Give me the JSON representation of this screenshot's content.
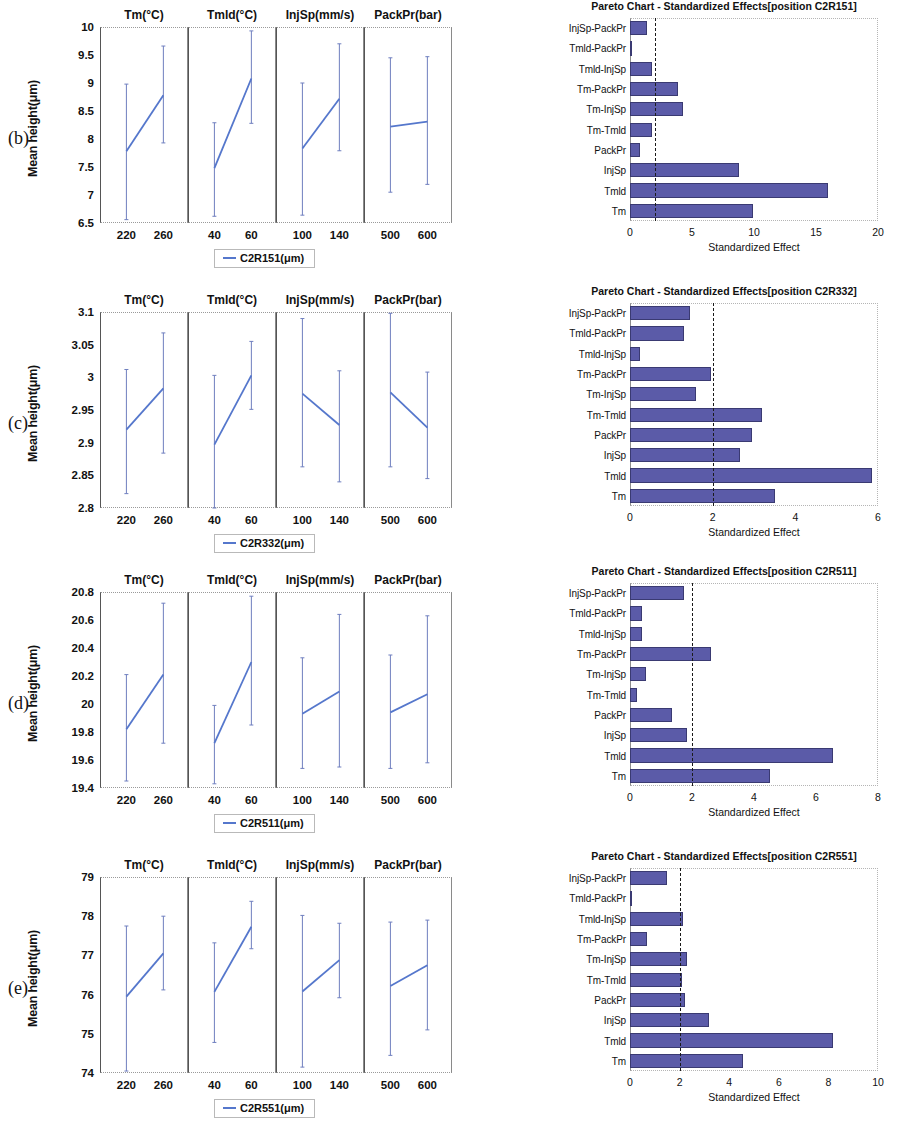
{
  "figure": {
    "panels": [
      {
        "letter": "(b)",
        "main_effects": {
          "ylabel": "Mean height(μm)",
          "legend_label": "C2R151(μm)",
          "yticks": [
            "6.5",
            "7",
            "7.5",
            "8",
            "8.5",
            "9",
            "9.5",
            "10"
          ],
          "facets": [
            {
              "title": "Tm(°C)",
              "xticks": [
                "220",
                "260"
              ]
            },
            {
              "title": "Tmld(°C)",
              "xticks": [
                "40",
                "60"
              ]
            },
            {
              "title": "InjSp(mm/s)",
              "xticks": [
                "100",
                "140"
              ]
            },
            {
              "title": "PackPr(bar)",
              "xticks": [
                "500",
                "600"
              ]
            }
          ]
        },
        "pareto": {
          "title": "Pareto Chart - Standardized Effects[position C2R151]",
          "xlabel": "Standardized Effect",
          "xticks": [
            "0",
            "5",
            "10",
            "15",
            "20"
          ]
        }
      },
      {
        "letter": "(c)",
        "main_effects": {
          "ylabel": "Mean height(μm)",
          "legend_label": "C2R332(μm)",
          "yticks": [
            "2.8",
            "2.85",
            "2.9",
            "2.95",
            "3",
            "3.05",
            "3.1"
          ],
          "facets": [
            {
              "title": "Tm(°C)",
              "xticks": [
                "220",
                "260"
              ]
            },
            {
              "title": "Tmld(°C)",
              "xticks": [
                "40",
                "60"
              ]
            },
            {
              "title": "InjSp(mm/s)",
              "xticks": [
                "100",
                "140"
              ]
            },
            {
              "title": "PackPr(bar)",
              "xticks": [
                "500",
                "600"
              ]
            }
          ]
        },
        "pareto": {
          "title": "Pareto Chart - Standardized Effects[position C2R332]",
          "xlabel": "Standardized Effect",
          "xticks": [
            "0",
            "2",
            "4",
            "6"
          ]
        }
      },
      {
        "letter": "(d)",
        "main_effects": {
          "ylabel": "Mean height(μm)",
          "legend_label": "C2R511(μm)",
          "yticks": [
            "19.4",
            "19.6",
            "19.8",
            "20",
            "20.2",
            "20.4",
            "20.6",
            "20.8"
          ],
          "facets": [
            {
              "title": "Tm(°C)",
              "xticks": [
                "220",
                "260"
              ]
            },
            {
              "title": "Tmld(°C)",
              "xticks": [
                "40",
                "60"
              ]
            },
            {
              "title": "InjSp(mm/s)",
              "xticks": [
                "100",
                "140"
              ]
            },
            {
              "title": "PackPr(bar)",
              "xticks": [
                "500",
                "600"
              ]
            }
          ]
        },
        "pareto": {
          "title": "Pareto Chart - Standardized Effects[position C2R511]",
          "xlabel": "Standardized Effect",
          "xticks": [
            "0",
            "2",
            "4",
            "6",
            "8"
          ]
        }
      },
      {
        "letter": "(e)",
        "main_effects": {
          "ylabel": "Mean height(μm)",
          "legend_label": "C2R551(μm)",
          "yticks": [
            "74",
            "75",
            "76",
            "77",
            "78",
            "79"
          ],
          "facets": [
            {
              "title": "Tm(°C)",
              "xticks": [
                "220",
                "260"
              ]
            },
            {
              "title": "Tmld(°C)",
              "xticks": [
                "40",
                "60"
              ]
            },
            {
              "title": "InjSp(mm/s)",
              "xticks": [
                "100",
                "140"
              ]
            },
            {
              "title": "PackPr(bar)",
              "xticks": [
                "500",
                "600"
              ]
            }
          ]
        },
        "pareto": {
          "title": "Pareto Chart - Standardized Effects[position C2R551]",
          "xlabel": "Standardized Effect",
          "xticks": [
            "0",
            "2",
            "4",
            "6",
            "8",
            "10"
          ]
        }
      }
    ]
  },
  "chart_data": [
    {
      "id": "C2R151-main-effects",
      "type": "line",
      "title": "",
      "panel": "(b)",
      "ylabel": "Mean height(μm)",
      "ylim": [
        6.5,
        10
      ],
      "yticks": [
        6.5,
        7,
        7.5,
        8,
        8.5,
        9,
        9.5,
        10
      ],
      "grid": false,
      "legend": "C2R151(μm)",
      "legend_position": "bottom-center",
      "error_bars": true,
      "factors": [
        {
          "name": "Tm",
          "xlabel": "Tm(°C)",
          "levels": [
            "220",
            "260"
          ],
          "means": [
            7.78,
            8.78
          ],
          "lower": [
            6.56,
            7.93
          ],
          "upper": [
            8.98,
            9.66
          ]
        },
        {
          "name": "Tmld",
          "xlabel": "Tmld(°C)",
          "levels": [
            "40",
            "60"
          ],
          "means": [
            7.48,
            9.08
          ],
          "lower": [
            6.62,
            8.28
          ],
          "upper": [
            8.29,
            9.93
          ]
        },
        {
          "name": "InjSp",
          "xlabel": "InjSp(mm/s)",
          "levels": [
            "100",
            "140"
          ],
          "means": [
            7.83,
            8.72
          ],
          "lower": [
            6.64,
            7.79
          ],
          "upper": [
            9.0,
            9.7
          ]
        },
        {
          "name": "PackPr",
          "xlabel": "PackPr(bar)",
          "levels": [
            "500",
            "600"
          ],
          "means": [
            8.22,
            8.31
          ],
          "lower": [
            7.05,
            7.19
          ],
          "upper": [
            9.45,
            9.47
          ]
        }
      ]
    },
    {
      "id": "C2R151-pareto",
      "type": "bar",
      "orientation": "horizontal",
      "panel": "(b)",
      "title": "Pareto Chart - Standardized Effects[position C2R151]",
      "xlabel": "Standardized Effect",
      "ylabel": "",
      "xlim": [
        0,
        20
      ],
      "xticks": [
        0,
        5,
        10,
        15,
        20
      ],
      "threshold": 2.0,
      "threshold_style": "dashed",
      "bar_color": "#5B5BA8",
      "categories": [
        "InjSp-PackPr",
        "Tmld-PackPr",
        "Tmld-InjSp",
        "Tm-PackPr",
        "Tm-InjSp",
        "Tm-Tmld",
        "PackPr",
        "InjSp",
        "Tmld",
        "Tm"
      ],
      "values": [
        1.4,
        0.15,
        1.8,
        3.9,
        4.3,
        1.8,
        0.8,
        8.8,
        16.0,
        9.9
      ]
    },
    {
      "id": "C2R332-main-effects",
      "type": "line",
      "panel": "(c)",
      "ylabel": "Mean height(μm)",
      "ylim": [
        2.8,
        3.1
      ],
      "yticks": [
        2.8,
        2.85,
        2.9,
        2.95,
        3.0,
        3.05,
        3.1
      ],
      "grid": false,
      "legend": "C2R332(μm)",
      "legend_position": "bottom-center",
      "error_bars": true,
      "factors": [
        {
          "name": "Tm",
          "xlabel": "Tm(°C)",
          "levels": [
            "220",
            "260"
          ],
          "means": [
            2.92,
            2.983
          ],
          "lower": [
            2.822,
            2.884
          ],
          "upper": [
            3.012,
            3.068
          ]
        },
        {
          "name": "Tmld",
          "xlabel": "Tmld(°C)",
          "levels": [
            "40",
            "60"
          ],
          "means": [
            2.897,
            3.003
          ],
          "lower": [
            2.8,
            2.951
          ],
          "upper": [
            3.003,
            3.055
          ]
        },
        {
          "name": "InjSp",
          "xlabel": "InjSp(mm/s)",
          "levels": [
            "100",
            "140"
          ],
          "means": [
            2.975,
            2.927
          ],
          "lower": [
            2.863,
            2.84
          ],
          "upper": [
            3.09,
            3.01
          ]
        },
        {
          "name": "PackPr",
          "xlabel": "PackPr(bar)",
          "levels": [
            "500",
            "600"
          ],
          "means": [
            2.977,
            2.923
          ],
          "lower": [
            2.863,
            2.845
          ],
          "upper": [
            3.098,
            3.008
          ]
        }
      ]
    },
    {
      "id": "C2R332-pareto",
      "type": "bar",
      "orientation": "horizontal",
      "panel": "(c)",
      "title": "Pareto Chart - Standardized Effects[position C2R332]",
      "xlabel": "Standardized Effect",
      "xlim": [
        0,
        6
      ],
      "xticks": [
        0,
        2,
        4,
        6
      ],
      "threshold": 2.0,
      "threshold_style": "dashed",
      "bar_color": "#5B5BA8",
      "categories": [
        "InjSp-PackPr",
        "Tmld-PackPr",
        "Tmld-InjSp",
        "Tm-PackPr",
        "Tm-InjSp",
        "Tm-Tmld",
        "PackPr",
        "InjSp",
        "Tmld",
        "Tm"
      ],
      "values": [
        1.45,
        1.3,
        0.25,
        1.95,
        1.6,
        3.2,
        2.95,
        2.65,
        5.85,
        3.5
      ]
    },
    {
      "id": "C2R511-main-effects",
      "type": "line",
      "panel": "(d)",
      "ylabel": "Mean height(μm)",
      "ylim": [
        19.4,
        20.8
      ],
      "yticks": [
        19.4,
        19.6,
        19.8,
        20.0,
        20.2,
        20.4,
        20.6,
        20.8
      ],
      "grid": false,
      "legend": "C2R511(μm)",
      "legend_position": "bottom-center",
      "error_bars": true,
      "factors": [
        {
          "name": "Tm",
          "xlabel": "Tm(°C)",
          "levels": [
            "220",
            "260"
          ],
          "means": [
            19.82,
            20.21
          ],
          "lower": [
            19.45,
            19.72
          ],
          "upper": [
            20.21,
            20.72
          ]
        },
        {
          "name": "Tmld",
          "xlabel": "Tmld(°C)",
          "levels": [
            "40",
            "60"
          ],
          "means": [
            19.72,
            20.3
          ],
          "lower": [
            19.43,
            19.85
          ],
          "upper": [
            19.99,
            20.77
          ]
        },
        {
          "name": "InjSp",
          "xlabel": "InjSp(mm/s)",
          "levels": [
            "100",
            "140"
          ],
          "means": [
            19.93,
            20.09
          ],
          "lower": [
            19.54,
            19.55
          ],
          "upper": [
            20.33,
            20.64
          ]
        },
        {
          "name": "PackPr",
          "xlabel": "PackPr(bar)",
          "levels": [
            "500",
            "600"
          ],
          "means": [
            19.94,
            20.07
          ],
          "lower": [
            19.54,
            19.58
          ],
          "upper": [
            20.35,
            20.63
          ]
        }
      ]
    },
    {
      "id": "C2R511-pareto",
      "type": "bar",
      "orientation": "horizontal",
      "panel": "(d)",
      "title": "Pareto Chart - Standardized Effects[position C2R511]",
      "xlabel": "Standardized Effect",
      "xlim": [
        0,
        8
      ],
      "xticks": [
        0,
        2,
        4,
        6,
        8
      ],
      "threshold": 2.0,
      "threshold_style": "dashed",
      "bar_color": "#5B5BA8",
      "categories": [
        "InjSp-PackPr",
        "Tmld-PackPr",
        "Tmld-InjSp",
        "Tm-PackPr",
        "Tm-InjSp",
        "Tm-Tmld",
        "PackPr",
        "InjSp",
        "Tmld",
        "Tm"
      ],
      "values": [
        1.75,
        0.4,
        0.4,
        2.6,
        0.5,
        0.22,
        1.35,
        1.85,
        6.55,
        4.5
      ]
    },
    {
      "id": "C2R551-main-effects",
      "type": "line",
      "panel": "(e)",
      "ylabel": "Mean height(μm)",
      "ylim": [
        74,
        79
      ],
      "yticks": [
        74,
        75,
        76,
        77,
        78,
        79
      ],
      "grid": false,
      "legend": "C2R551(μm)",
      "legend_position": "bottom-center",
      "error_bars": true,
      "factors": [
        {
          "name": "Tm",
          "xlabel": "Tm(°C)",
          "levels": [
            "220",
            "260"
          ],
          "means": [
            75.95,
            77.05
          ],
          "lower": [
            74.05,
            76.12
          ],
          "upper": [
            77.75,
            78.0
          ]
        },
        {
          "name": "Tmld",
          "xlabel": "Tmld(°C)",
          "levels": [
            "40",
            "60"
          ],
          "means": [
            76.07,
            77.73
          ],
          "lower": [
            74.78,
            77.17
          ],
          "upper": [
            77.32,
            78.38
          ]
        },
        {
          "name": "InjSp",
          "xlabel": "InjSp(mm/s)",
          "levels": [
            "100",
            "140"
          ],
          "means": [
            76.08,
            76.88
          ],
          "lower": [
            74.15,
            75.92
          ],
          "upper": [
            78.02,
            77.82
          ]
        },
        {
          "name": "PackPr",
          "xlabel": "PackPr(bar)",
          "levels": [
            "500",
            "600"
          ],
          "means": [
            76.22,
            76.75
          ],
          "lower": [
            74.45,
            75.1
          ],
          "upper": [
            77.85,
            77.9
          ]
        }
      ]
    },
    {
      "id": "C2R551-pareto",
      "type": "bar",
      "orientation": "horizontal",
      "panel": "(e)",
      "title": "Pareto Chart - Standardized Effects[position C2R551]",
      "xlabel": "Standardized Effect",
      "xlim": [
        0,
        10
      ],
      "xticks": [
        0,
        2,
        4,
        6,
        8,
        10
      ],
      "threshold": 2.0,
      "threshold_style": "dashed",
      "bar_color": "#5B5BA8",
      "categories": [
        "InjSp-PackPr",
        "Tmld-PackPr",
        "Tmld-InjSp",
        "Tm-PackPr",
        "Tm-InjSp",
        "Tm-Tmld",
        "PackPr",
        "InjSp",
        "Tmld",
        "Tm"
      ],
      "values": [
        1.5,
        0.04,
        2.15,
        0.7,
        2.3,
        2.1,
        2.2,
        3.2,
        8.2,
        4.55
      ]
    }
  ]
}
